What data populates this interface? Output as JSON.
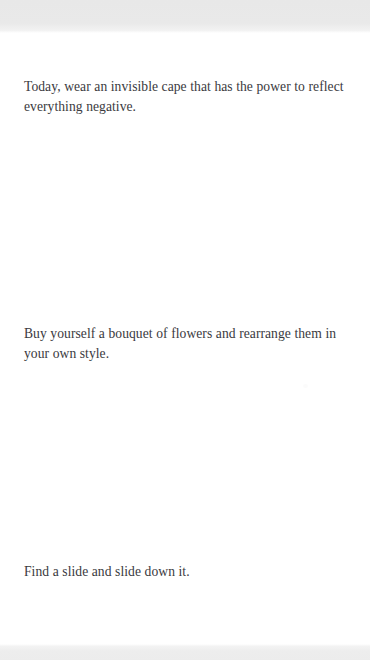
{
  "app": {
    "background_color": "#ffffff",
    "text_color": "#3a3a3e",
    "band_color": "#ebebeb"
  },
  "chrome": {
    "top_band_label": "top-status-band",
    "bottom_band_label": "bottom-nav-band"
  },
  "main": {
    "prompts": [
      {
        "id": "prompt-1",
        "text": "Today, wear an invisible cape that has the power to reflect everything negative."
      },
      {
        "id": "prompt-2",
        "text": "Buy yourself a bouquet of flowers and rearrange them in your own style."
      },
      {
        "id": "prompt-3",
        "text": "Find a slide and slide down it."
      }
    ]
  }
}
